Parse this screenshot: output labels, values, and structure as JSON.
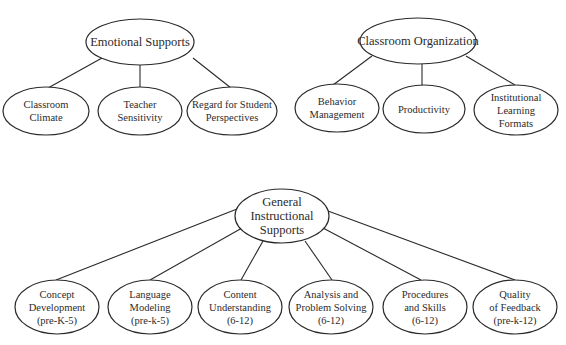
{
  "diagram": {
    "type": "hierarchy",
    "groups": [
      {
        "id": "emotional",
        "root": {
          "label_lines": [
            "Emotional Supports"
          ],
          "cx": 140,
          "cy": 42,
          "rx": 54,
          "ry": 23
        },
        "children": [
          {
            "label_lines": [
              "Classroom",
              "Climate"
            ],
            "cx": 46,
            "cy": 111,
            "rx": 43,
            "ry": 24
          },
          {
            "label_lines": [
              "Teacher",
              "Sensitivity"
            ],
            "cx": 140,
            "cy": 111,
            "rx": 42,
            "ry": 24
          },
          {
            "label_lines": [
              "Regard for Student",
              "Perspectives"
            ],
            "cx": 232,
            "cy": 111,
            "rx": 45,
            "ry": 24
          }
        ]
      },
      {
        "id": "organization",
        "root": {
          "label_lines": [
            "Classroom Organization"
          ],
          "cx": 418,
          "cy": 41,
          "rx": 58,
          "ry": 23
        },
        "children": [
          {
            "label_lines": [
              "Behavior",
              "Management"
            ],
            "cx": 337,
            "cy": 108,
            "rx": 42,
            "ry": 24
          },
          {
            "label_lines": [
              "Productivity"
            ],
            "cx": 424,
            "cy": 109,
            "rx": 41,
            "ry": 24
          },
          {
            "label_lines": [
              "Institutional",
              "Learning",
              "Formats"
            ],
            "cx": 516,
            "cy": 110,
            "rx": 42,
            "ry": 25
          }
        ]
      },
      {
        "id": "instructional",
        "root": {
          "label_lines": [
            "General",
            "Instructional",
            "Supports"
          ],
          "cx": 282,
          "cy": 216,
          "rx": 47,
          "ry": 27
        },
        "children": [
          {
            "label_lines": [
              "Concept",
              "Development",
              "(pre-K-5)"
            ],
            "cx": 57,
            "cy": 307,
            "rx": 42,
            "ry": 27
          },
          {
            "label_lines": [
              "Language",
              "Modeling",
              "(pre-k-5)"
            ],
            "cx": 150,
            "cy": 307,
            "rx": 42,
            "ry": 27
          },
          {
            "label_lines": [
              "Content",
              "Understanding",
              "(6-12)"
            ],
            "cx": 240,
            "cy": 307,
            "rx": 42,
            "ry": 27
          },
          {
            "label_lines": [
              "Analysis and",
              "Problem Solving",
              "(6-12)"
            ],
            "cx": 331,
            "cy": 307,
            "rx": 42,
            "ry": 27
          },
          {
            "label_lines": [
              "Procedures",
              "and Skills",
              "(6-12)"
            ],
            "cx": 425,
            "cy": 307,
            "rx": 42,
            "ry": 27
          },
          {
            "label_lines": [
              "Quality",
              "of Feedback",
              "(pre-k-12)"
            ],
            "cx": 515,
            "cy": 307,
            "rx": 42,
            "ry": 27
          }
        ]
      }
    ]
  },
  "labels": {
    "emotional": {
      "root": "Emotional Supports",
      "c0a": "Classroom",
      "c0b": "Climate",
      "c1a": "Teacher",
      "c1b": "Sensitivity",
      "c2a": "Regard for Student",
      "c2b": "Perspectives"
    },
    "organization": {
      "root": "Classroom Organization",
      "c0a": "Behavior",
      "c0b": "Management",
      "c1a": "Productivity",
      "c2a": "Institutional",
      "c2b": "Learning",
      "c2c": "Formats"
    },
    "instructional": {
      "root_a": "General",
      "root_b": "Instructional",
      "root_c": "Supports",
      "c0a": "Concept",
      "c0b": "Development",
      "c0c": "(pre-K-5)",
      "c1a": "Language",
      "c1b": "Modeling",
      "c1c": "(pre-k-5)",
      "c2a": "Content",
      "c2b": "Understanding",
      "c2c": "(6-12)",
      "c3a": "Analysis and",
      "c3b": "Problem Solving",
      "c3c": "(6-12)",
      "c4a": "Procedures",
      "c4b": "and Skills",
      "c4c": "(6-12)",
      "c5a": "Quality",
      "c5b": "of Feedback",
      "c5c": "(pre-k-12)"
    }
  },
  "colors": {
    "stroke": "#2a2a2a",
    "text": "#2b2b2b",
    "background": "#ffffff"
  }
}
